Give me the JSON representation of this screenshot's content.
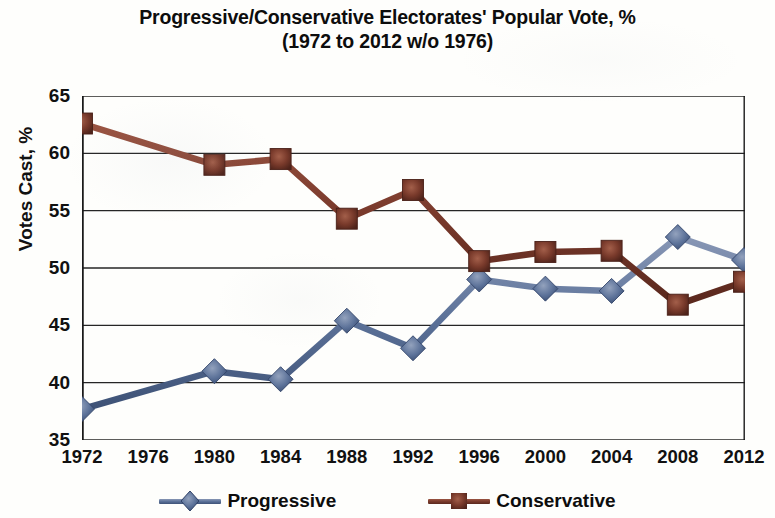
{
  "chart_data": {
    "type": "line",
    "title": "Progressive/Conservative Electorates' Popular Vote, %",
    "subtitle": "(1972 to 2012 w/o 1976)",
    "xlabel": "",
    "ylabel": "Votes Cast, %",
    "categories": [
      "1972",
      "1976",
      "1980",
      "1984",
      "1988",
      "1992",
      "1996",
      "2000",
      "2004",
      "2008",
      "2012"
    ],
    "ylim": [
      35,
      65
    ],
    "yticks": [
      35,
      40,
      45,
      50,
      55,
      60,
      65
    ],
    "grid": "horizontal",
    "legend_position": "bottom",
    "series": [
      {
        "name": "Progressive",
        "color": "#5b7198",
        "marker": "diamond",
        "values": [
          37.7,
          null,
          41.0,
          40.3,
          45.4,
          43.0,
          49.0,
          48.2,
          48.0,
          52.7,
          50.7
        ]
      },
      {
        "name": "Conservative",
        "color": "#7a3a2c",
        "marker": "square",
        "values": [
          62.6,
          null,
          59.0,
          59.5,
          54.3,
          56.8,
          50.6,
          51.4,
          51.5,
          46.8,
          48.8
        ]
      }
    ]
  },
  "legend": {
    "items": [
      {
        "label": "Progressive"
      },
      {
        "label": "Conservative"
      }
    ]
  },
  "colors": {
    "progressive": "#5b7198",
    "conservative": "#7a3a2c",
    "axis": "#1a1a1a",
    "grid": "#262626",
    "background": "#fefefc"
  }
}
